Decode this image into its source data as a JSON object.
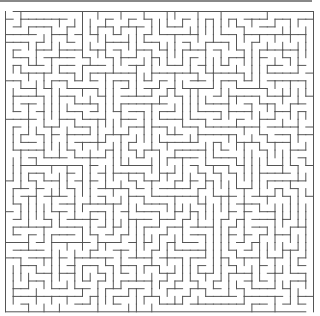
{
  "maze": {
    "cols": 40,
    "rows": 39,
    "cell": 7.7,
    "origin_x": 5.5,
    "origin_y": 11.5,
    "wall_color": "#555555",
    "seed": 12345,
    "entrance": "top-left",
    "exit": "bottom-right"
  }
}
